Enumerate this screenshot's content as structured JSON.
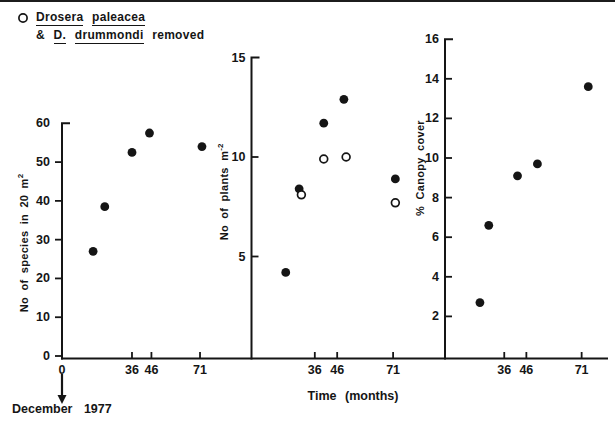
{
  "legend": {
    "marker": "open-circle",
    "line1": {
      "w1": "Drosera",
      "w2": "paleacea"
    },
    "line2": {
      "w1": "&",
      "w2": "D.",
      "w3": "drummondi",
      "w4": "removed"
    }
  },
  "time_axis": {
    "label": "Time (months)"
  },
  "baseline_note": {
    "label": "December 1977"
  },
  "colors": {
    "ink": "#151515",
    "background": "#ffffff"
  },
  "chart_data": {
    "type": "scatter",
    "x_unit": "months since December 1977",
    "legend_position": "top-left",
    "grid": false,
    "panels": [
      {
        "name": "species-richness",
        "ylabel": {
          "text": "No of species in 20 m",
          "sup": "2"
        },
        "ylim": [
          0,
          60
        ],
        "ytick_side": "left",
        "yticks": [
          {
            "v": 0,
            "label": "0"
          },
          {
            "v": 10,
            "label": "10"
          },
          {
            "v": 20,
            "label": "20"
          },
          {
            "v": 30,
            "label": "30"
          },
          {
            "v": 40,
            "label": "40"
          },
          {
            "v": 50,
            "label": "50"
          },
          {
            "v": 60,
            "label": "60"
          }
        ],
        "xticks": [
          {
            "m": 0,
            "label": "0",
            "tick": false
          },
          {
            "m": 36,
            "label": "36",
            "tick": true
          },
          {
            "m": 46,
            "label": "46",
            "tick": true
          },
          {
            "m": 71,
            "label": "71",
            "tick": true
          }
        ],
        "series": [
          {
            "name": "filled-dots",
            "marker": "filled",
            "points": [
              {
                "m": 16,
                "v": 27
              },
              {
                "m": 22,
                "v": 38.5
              },
              {
                "m": 36,
                "v": 52.5
              },
              {
                "m": 45,
                "v": 57.5
              },
              {
                "m": 72,
                "v": 54
              }
            ]
          }
        ],
        "layout": {
          "axis_x": 62,
          "x_start_month": 0,
          "px_per_month": 1.944,
          "y_zero": 356,
          "px_per_unit": 3.878
        }
      },
      {
        "name": "plant-density",
        "ylabel": {
          "text": "No of plants m",
          "sup": "-2"
        },
        "ylim": [
          0,
          15
        ],
        "ytick_side": "right",
        "yticks": [
          {
            "v": 5,
            "label": "5"
          },
          {
            "v": 10,
            "label": "10"
          },
          {
            "v": 15,
            "label": "15"
          }
        ],
        "xticks": [
          {
            "m": 36,
            "label": "36",
            "tick": true
          },
          {
            "m": 46,
            "label": "46",
            "tick": true
          },
          {
            "m": 71,
            "label": "71",
            "tick": true
          }
        ],
        "series": [
          {
            "name": "filled-dots",
            "marker": "filled",
            "points": [
              {
                "m": 23,
                "v": 4.2
              },
              {
                "m": 29,
                "v": 8.4
              },
              {
                "m": 40,
                "v": 11.7
              },
              {
                "m": 49,
                "v": 12.9
              },
              {
                "m": 72,
                "v": 8.9
              }
            ]
          },
          {
            "name": "open-circles-drosera-removed",
            "marker": "open",
            "points": [
              {
                "m": 30,
                "v": 8.1
              },
              {
                "m": 40,
                "v": 9.9
              },
              {
                "m": 50,
                "v": 10.0
              },
              {
                "m": 72,
                "v": 7.7
              }
            ]
          }
        ],
        "layout": {
          "axis_x": 251.5,
          "x_start_month": 7.7,
          "px_per_month": 2.237,
          "y_zero": 356,
          "px_per_unit": 19.9
        }
      },
      {
        "name": "canopy-cover",
        "ylabel": {
          "text": "% Canopy cover",
          "sup": ""
        },
        "ylim": [
          0,
          16
        ],
        "ytick_side": "right",
        "yticks": [
          {
            "v": 2,
            "label": "2"
          },
          {
            "v": 4,
            "label": "4"
          },
          {
            "v": 6,
            "label": "6"
          },
          {
            "v": 8,
            "label": "8"
          },
          {
            "v": 10,
            "label": "10"
          },
          {
            "v": 12,
            "label": "12"
          },
          {
            "v": 14,
            "label": "14"
          },
          {
            "v": 16,
            "label": "16"
          }
        ],
        "xticks": [
          {
            "m": 36,
            "label": "36",
            "tick": true
          },
          {
            "m": 46,
            "label": "46",
            "tick": true
          },
          {
            "m": 71,
            "label": "71",
            "tick": true
          }
        ],
        "series": [
          {
            "name": "filled-dots",
            "marker": "filled",
            "points": [
              {
                "m": 25,
                "v": 2.7
              },
              {
                "m": 29,
                "v": 6.6
              },
              {
                "m": 42,
                "v": 9.1
              },
              {
                "m": 51,
                "v": 9.7
              },
              {
                "m": 74,
                "v": 13.6
              }
            ]
          }
        ],
        "layout": {
          "axis_x": 445,
          "x_start_month": 9.2,
          "px_per_month": 2.211,
          "y_zero": 356,
          "px_per_unit": 19.8
        }
      }
    ]
  }
}
